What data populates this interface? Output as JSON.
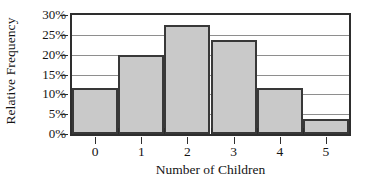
{
  "chart_data": {
    "type": "bar",
    "title": "",
    "subtitle": "",
    "xlabel": "Number of Children",
    "ylabel": "Relative Frequency",
    "categories": [
      "0",
      "1",
      "2",
      "3",
      "4",
      "5"
    ],
    "values": [
      11.7,
      19.8,
      27.5,
      23.7,
      11.5,
      3.7
    ],
    "value_suffix": "%",
    "ylim": [
      0,
      30
    ],
    "ytick_values": [
      30,
      25,
      20,
      15,
      10,
      5,
      0
    ],
    "ytick_labels": [
      "30%",
      "25%",
      "20%",
      "15%",
      "10%",
      "5%",
      "0%"
    ],
    "ystep": 5,
    "grid": true,
    "grid_axis": "y",
    "legend": false,
    "legend_position": "none",
    "annotations": [],
    "series": [
      {
        "name": "Relative Frequency",
        "values": [
          11.7,
          19.8,
          27.5,
          23.7,
          11.5,
          3.7
        ]
      }
    ],
    "style": {
      "bar_fill": "#c9c9c9",
      "bar_border": "#383838",
      "grid_color": "#8e8e8e",
      "axis_color": "#2e2e2e",
      "text_color": "#141414",
      "background": "#ffffff"
    }
  }
}
